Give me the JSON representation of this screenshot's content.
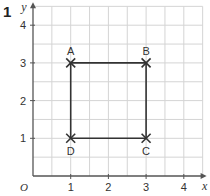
{
  "question_number": "1",
  "axes": {
    "x_label": "x",
    "y_label": "y",
    "origin_label": "O",
    "x_ticks": [
      "1",
      "2",
      "3",
      "4"
    ],
    "y_ticks": [
      "1",
      "2",
      "3",
      "4"
    ],
    "grid_step": 0.5,
    "x_range": [
      0,
      4.5
    ],
    "y_range": [
      0,
      4.5
    ]
  },
  "points": [
    {
      "label": "A",
      "x": 1,
      "y": 3,
      "label_pos": "above"
    },
    {
      "label": "B",
      "x": 3,
      "y": 3,
      "label_pos": "above"
    },
    {
      "label": "C",
      "x": 3,
      "y": 1,
      "label_pos": "below"
    },
    {
      "label": "D",
      "x": 1,
      "y": 1,
      "label_pos": "below"
    }
  ],
  "shape": {
    "type": "square",
    "vertices": [
      "A",
      "B",
      "C",
      "D"
    ]
  },
  "colors": {
    "grid": "#d4d4d4",
    "axis": "#555555",
    "shape": "#333333",
    "text": "#333333"
  }
}
